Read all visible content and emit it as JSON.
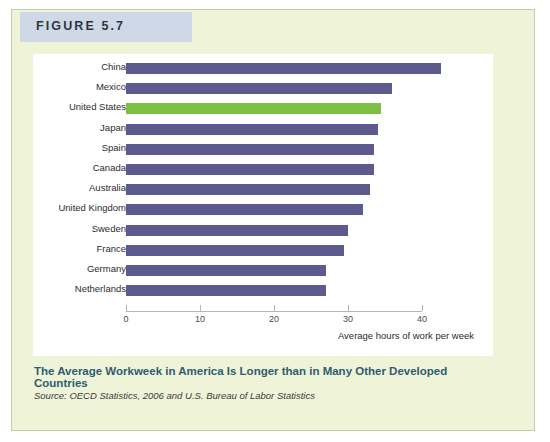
{
  "figure": {
    "tab_label": "FIGURE 5.7",
    "caption": "The Average Workweek in America Is Longer than in Many Other Developed Countries",
    "source": "Source: OECD Statistics, 2006 and U.S. Bureau of Labor Statistics",
    "accent_color": "#2e5d72",
    "tab_color": "#cfd8e6",
    "page_color": "#eff4d9"
  },
  "chart_data": {
    "type": "bar",
    "orientation": "horizontal",
    "title": "",
    "subtitle": "",
    "xlabel": "Average hours of work per week",
    "ylabel": "",
    "xlim": [
      0,
      45
    ],
    "xticks": [
      0,
      10,
      20,
      30,
      40
    ],
    "xticklabels": [
      "0",
      "10",
      "20",
      "30",
      "40"
    ],
    "grid": false,
    "legend": null,
    "bar_color": "#5d5a8e",
    "highlight_color": "#7ec043",
    "highlight_category": "United States",
    "categories": [
      "China",
      "Mexico",
      "United States",
      "Japan",
      "Spain",
      "Canada",
      "Australia",
      "United Kingdom",
      "Sweden",
      "France",
      "Germany",
      "Netherlands"
    ],
    "values": [
      42.5,
      36,
      34.5,
      34,
      33.5,
      33.5,
      33,
      32,
      30,
      29.5,
      27,
      27
    ]
  }
}
